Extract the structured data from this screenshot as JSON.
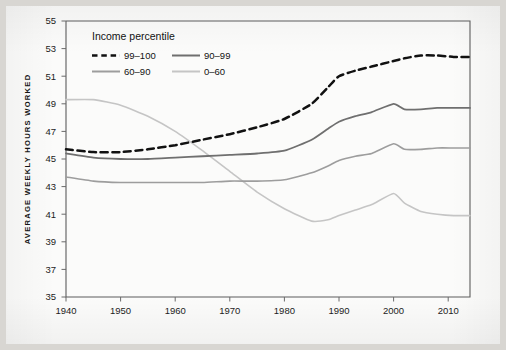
{
  "figure": {
    "background_color": "#d8d6d2",
    "paper_color": "#fbfbfa"
  },
  "chart_data": {
    "type": "line",
    "title": "",
    "xlabel": "",
    "ylabel": "AVERAGE WEEKLY HOURS WORKED",
    "xlim": [
      1940,
      2014
    ],
    "ylim": [
      35,
      55
    ],
    "grid": false,
    "legend": {
      "title": "Income percentile",
      "position": "top-left-inside",
      "entries": [
        {
          "label": "99–100",
          "color": "#111111",
          "style": "dashed"
        },
        {
          "label": "90–99",
          "color": "#6f6f6f",
          "style": "solid"
        },
        {
          "label": "60–90",
          "color": "#9d9d9d",
          "style": "solid"
        },
        {
          "label": "0–60",
          "color": "#c5c5c5",
          "style": "solid"
        }
      ]
    },
    "xticks": [
      1940,
      1950,
      1960,
      1970,
      1980,
      1990,
      2000,
      2010
    ],
    "xtick_labels": [
      "1940",
      "1950",
      "1960",
      "1970",
      "1980",
      "1990",
      "2000",
      "2010"
    ],
    "yticks": [
      35,
      37,
      39,
      41,
      43,
      45,
      47,
      49,
      51,
      53,
      55
    ],
    "ytick_labels": [
      "35",
      "37",
      "39",
      "41",
      "43",
      "45",
      "47",
      "49",
      "51",
      "53",
      "55"
    ],
    "x": [
      1940,
      1945,
      1950,
      1955,
      1960,
      1965,
      1970,
      1975,
      1980,
      1985,
      1988,
      1990,
      1993,
      1996,
      2000,
      2002,
      2005,
      2008,
      2011,
      2014
    ],
    "series": [
      {
        "name": "99–100",
        "color": "#111111",
        "style": "dashed",
        "values": [
          45.7,
          45.5,
          45.5,
          45.7,
          46.0,
          46.4,
          46.8,
          47.3,
          47.9,
          49.0,
          50.2,
          51.0,
          51.4,
          51.7,
          52.1,
          52.3,
          52.5,
          52.5,
          52.4,
          52.4
        ]
      },
      {
        "name": "90–99",
        "color": "#6f6f6f",
        "style": "solid",
        "values": [
          45.4,
          45.1,
          45.0,
          45.0,
          45.1,
          45.2,
          45.3,
          45.4,
          45.6,
          46.4,
          47.2,
          47.7,
          48.1,
          48.4,
          49.0,
          48.6,
          48.6,
          48.7,
          48.7,
          48.7
        ]
      },
      {
        "name": "60–90",
        "color": "#9d9d9d",
        "style": "solid",
        "values": [
          43.7,
          43.4,
          43.3,
          43.3,
          43.3,
          43.3,
          43.4,
          43.4,
          43.5,
          44.0,
          44.5,
          44.9,
          45.2,
          45.4,
          46.1,
          45.7,
          45.7,
          45.8,
          45.8,
          45.8
        ]
      },
      {
        "name": "0–60",
        "color": "#c5c5c5",
        "style": "solid",
        "values": [
          49.3,
          49.3,
          48.9,
          48.1,
          47.0,
          45.6,
          44.1,
          42.6,
          41.4,
          40.5,
          40.6,
          40.9,
          41.3,
          41.7,
          42.5,
          41.8,
          41.2,
          41.0,
          40.9,
          40.9
        ]
      }
    ]
  }
}
